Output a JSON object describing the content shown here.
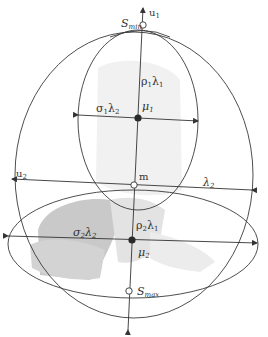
{
  "diagram": {
    "labels": {
      "s_min": "S",
      "s_min_sub": "min",
      "s_max": "S",
      "s_max_sub": "max",
      "u1": "u",
      "u1_sub": "1",
      "u2": "u",
      "u2_sub": "2",
      "m": "m",
      "mu1": "μ",
      "mu1_sub": "1",
      "mu2": "μ",
      "mu2_sub": "2",
      "rho1_lambda1": {
        "a": "ρ",
        "a_sub": "1",
        "b": "λ",
        "b_sub": "1"
      },
      "sigma1_lambda2": {
        "a": "σ",
        "a_sub": "1",
        "b": "λ",
        "b_sub": "2"
      },
      "rho2_lambda1": {
        "a": "ρ",
        "a_sub": "2",
        "b": "λ",
        "b_sub": "1"
      },
      "sigma2_lambda2": {
        "a": "σ",
        "a_sub": "2",
        "b": "λ",
        "b_sub": "2"
      },
      "lambda2": {
        "a": "λ",
        "a_sub": "2"
      }
    },
    "colors": {
      "stroke": "#3a3a3a",
      "shade": "#d6d6d6",
      "shade_light": "#ececec",
      "point_fill": "#2a2a2a"
    }
  }
}
